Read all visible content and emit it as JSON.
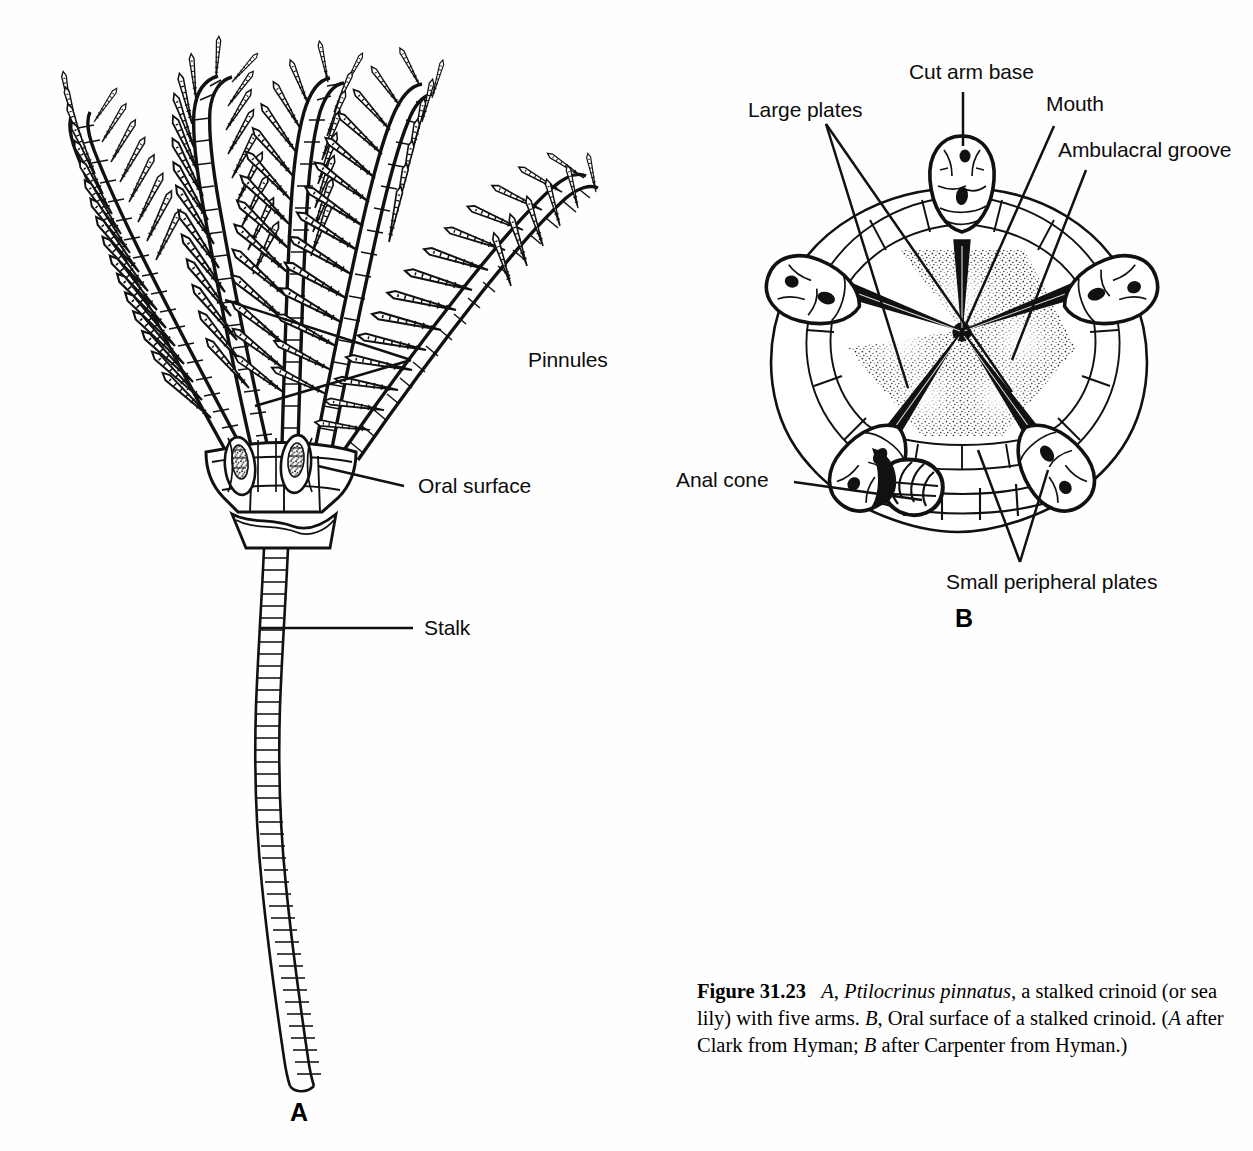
{
  "figure": {
    "panelA": {
      "letter": "A",
      "labels": [
        {
          "id": "pinnules",
          "text": "Pinnules"
        },
        {
          "id": "oral-surface",
          "text": "Oral surface"
        },
        {
          "id": "stalk",
          "text": "Stalk"
        }
      ]
    },
    "panelB": {
      "letter": "B",
      "labels": [
        {
          "id": "cut-arm-base",
          "text": "Cut arm base"
        },
        {
          "id": "large-plates",
          "text": "Large plates"
        },
        {
          "id": "mouth",
          "text": "Mouth"
        },
        {
          "id": "ambulacral-groove",
          "text": "Ambulacral groove"
        },
        {
          "id": "anal-cone",
          "text": "Anal cone"
        },
        {
          "id": "small-peripheral-plates",
          "text": "Small peripheral plates"
        }
      ]
    },
    "caption": {
      "figure_number": "Figure 31.23",
      "part_a_letter": "A",
      "species": "Ptilocrinus pinnatus",
      "text_1": ", a stalked crinoid (or sea lily) with five arms. ",
      "part_b_letter": "B",
      "text_2": ", Oral surface of a stalked crinoid. (",
      "credit_a_letter": "A",
      "credit_1": " after Clark from Hyman; ",
      "credit_b_letter": "B",
      "credit_2": " after Carpenter from Hyman.)"
    },
    "colors": {
      "ink": "#111111",
      "background": "#fefefe"
    }
  }
}
